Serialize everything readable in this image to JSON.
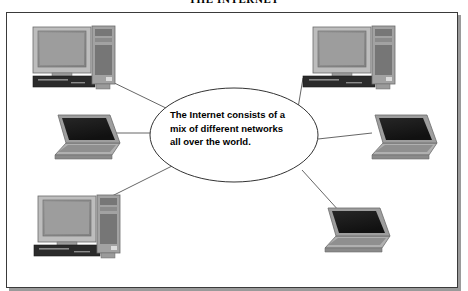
{
  "figure": {
    "title": "THE INTERNET",
    "caption_lines": [
      "The Internet consists of a",
      "mix of different networks",
      "all over the world."
    ],
    "caption_full": "The Internet consists of a mix of different networks all over the world."
  },
  "colors": {
    "background": "#ffffff",
    "border": "#3a3a3a",
    "shadow": "#9a9a9a",
    "line": "#555555",
    "text": "#000000",
    "monitor_bezel": "#b9b9b9",
    "monitor_screen": "#8e8e8e",
    "tower_body": "#9b9b9b",
    "tower_dark": "#6e6e6e",
    "keyboard": "#2e2e2e",
    "laptop_screen": "#1c1c1c",
    "laptop_base": "#a8a8a8"
  },
  "devices": [
    {
      "id": "desktop-top-left",
      "type": "desktop",
      "label": "Desktop computer"
    },
    {
      "id": "desktop-top-right",
      "type": "desktop",
      "label": "Desktop computer"
    },
    {
      "id": "desktop-bottom-left",
      "type": "desktop",
      "label": "Desktop computer"
    },
    {
      "id": "laptop-left",
      "type": "laptop",
      "label": "Laptop computer"
    },
    {
      "id": "laptop-right",
      "type": "laptop",
      "label": "Laptop computer"
    },
    {
      "id": "laptop-bottom-right",
      "type": "laptop",
      "label": "Laptop computer"
    }
  ],
  "connections": [
    {
      "from": "desktop-top-left",
      "to": "internet-cloud"
    },
    {
      "from": "desktop-top-right",
      "to": "internet-cloud"
    },
    {
      "from": "desktop-bottom-left",
      "to": "internet-cloud"
    },
    {
      "from": "laptop-left",
      "to": "internet-cloud"
    },
    {
      "from": "laptop-right",
      "to": "internet-cloud"
    },
    {
      "from": "laptop-bottom-right",
      "to": "internet-cloud"
    }
  ]
}
